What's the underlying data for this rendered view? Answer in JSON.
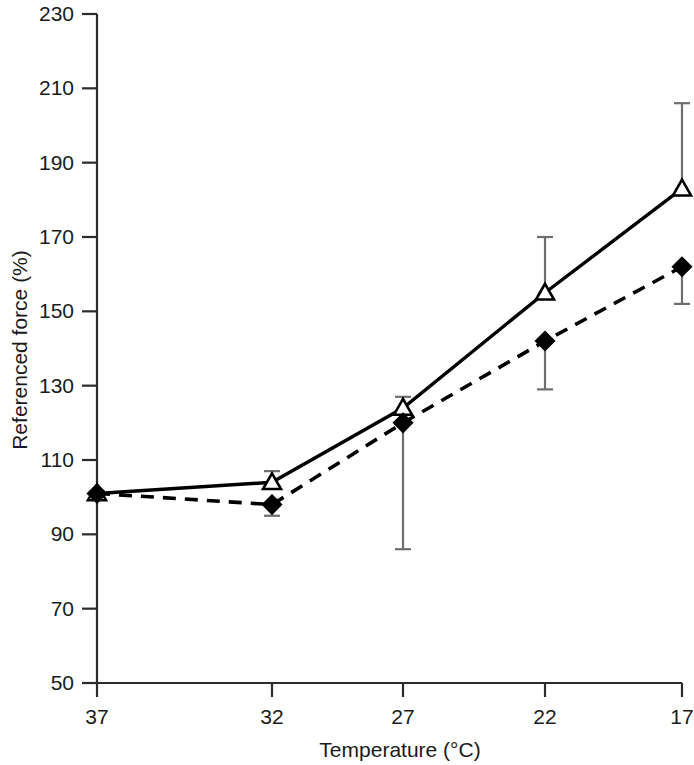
{
  "chart_data": {
    "type": "line",
    "title": "",
    "xlabel": "Temperature (°C)",
    "ylabel": "Referenced force (%)",
    "x": [
      37,
      32,
      27,
      22,
      17
    ],
    "categories": [
      "37",
      "32",
      "27",
      "22",
      "17"
    ],
    "xtick_labels": [
      "37",
      "32",
      "27",
      "22",
      "17"
    ],
    "ytick_labels": [
      "50",
      "70",
      "90",
      "110",
      "130",
      "150",
      "170",
      "190",
      "210",
      "230"
    ],
    "ylim": [
      50,
      230
    ],
    "ytick_step": 20,
    "grid": false,
    "legend": "none",
    "x_axis_direction": "decreasing",
    "series": [
      {
        "name": "open-triangle-series",
        "marker": "open-triangle",
        "line_style": "solid",
        "color": "#000000",
        "values": [
          101,
          104,
          124,
          155,
          183
        ],
        "err_upper": [
          101,
          107,
          127,
          170,
          206
        ],
        "err_lower": [
          101,
          104,
          120,
          155,
          183
        ]
      },
      {
        "name": "filled-diamond-series",
        "marker": "filled-diamond",
        "line_style": "dashed",
        "color": "#000000",
        "values": [
          101,
          98,
          120,
          142,
          162
        ],
        "err_upper": [
          101,
          98,
          120,
          142,
          162
        ],
        "err_lower": [
          101,
          95,
          86,
          129,
          152
        ]
      }
    ]
  },
  "axes": {
    "y_title": "Referenced force (%)",
    "x_title": "Temperature (°C)"
  },
  "colors": {
    "line": "#000000",
    "axis": "#2b2b2b",
    "errorbar": "#6e6e6e",
    "background": "#ffffff"
  }
}
